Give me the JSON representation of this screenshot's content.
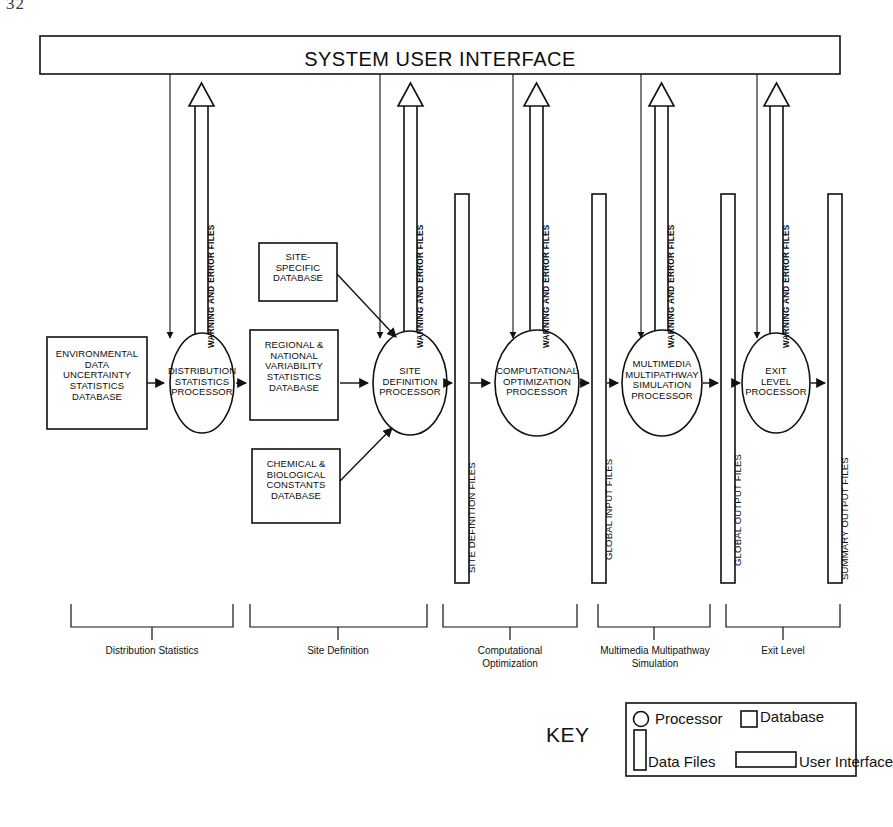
{
  "page": {
    "number": "32"
  },
  "diagram": {
    "title": "SYSTEM USER INTERFACE",
    "databases": [
      {
        "id": "env-data-uncertainty",
        "lines": [
          "ENVIRONMENTAL",
          "DATA",
          "UNCERTAINTY",
          "STATISTICS",
          "DATABASE"
        ]
      },
      {
        "id": "site-specific",
        "lines": [
          "SITE-",
          "SPECIFIC",
          "DATABASE"
        ]
      },
      {
        "id": "regional-national",
        "lines": [
          "REGIONAL &",
          "NATIONAL",
          "VARIABILITY",
          "STATISTICS",
          "DATABASE"
        ]
      },
      {
        "id": "chemical-biological",
        "lines": [
          "CHEMICAL &",
          "BIOLOGICAL",
          "CONSTANTS",
          "DATABASE"
        ]
      }
    ],
    "processors": [
      {
        "id": "distribution-statistics",
        "lines": [
          "DISTRIBUTION",
          "STATISTICS",
          "PROCESSOR"
        ]
      },
      {
        "id": "site-definition",
        "lines": [
          "SITE",
          "DEFINITION",
          "PROCESSOR"
        ]
      },
      {
        "id": "computational-optimization",
        "lines": [
          "COMPUTATIONAL",
          "OPTIMIZATION",
          "PROCESSOR"
        ]
      },
      {
        "id": "multimedia-multipathway",
        "lines": [
          "MULTIMEDIA",
          "MULTIPATHWAY",
          "SIMULATION",
          "PROCESSOR"
        ]
      },
      {
        "id": "exit-level",
        "lines": [
          "EXIT",
          "LEVEL",
          "PROCESSOR"
        ]
      }
    ],
    "data_files": [
      {
        "id": "site-definition-files",
        "label": "SITE DEFINITION FILES"
      },
      {
        "id": "global-input-files",
        "label": "GLOBAL INPUT FILES"
      },
      {
        "id": "global-output-files",
        "label": "GLOBAL OUTPUT FILES"
      },
      {
        "id": "summary-output-files",
        "label": "SUMMARY OUTPUT FILES"
      }
    ],
    "warning_label": "WARNING AND ERROR FILES",
    "warning_count": 5,
    "phases": [
      {
        "id": "distribution-statistics",
        "lines": [
          "Distribution Statistics"
        ]
      },
      {
        "id": "site-definition",
        "lines": [
          "Site Definition"
        ]
      },
      {
        "id": "computational-optimization",
        "lines": [
          "Computational",
          "Optimization"
        ]
      },
      {
        "id": "multimedia-multipathway",
        "lines": [
          "Multimedia Multipathway",
          "Simulation"
        ]
      },
      {
        "id": "exit-level",
        "lines": [
          "Exit Level"
        ]
      }
    ],
    "key": {
      "title": "KEY",
      "items": [
        {
          "id": "processor",
          "label": "Processor",
          "shape": "ellipse"
        },
        {
          "id": "database",
          "label": "Database",
          "shape": "square"
        },
        {
          "id": "data-files",
          "label": "Data Files",
          "shape": "tall-rect"
        },
        {
          "id": "user-interface",
          "label": "User Interface",
          "shape": "wide-rect"
        }
      ]
    }
  }
}
